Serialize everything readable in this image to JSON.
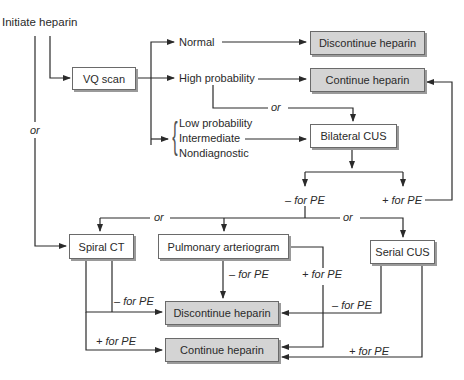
{
  "diagram": {
    "start": {
      "label": "Initiate heparin"
    },
    "nodes": {
      "vq_scan": "VQ scan",
      "discontinue_top": "Discontinue heparin",
      "continue_top": "Continue heparin",
      "bilateral_cus": "Bilateral CUS",
      "spiral_ct": "Spiral CT",
      "pulmonary_arteriogram": "Pulmonary arteriogram",
      "serial_cus": "Serial CUS",
      "discontinue_bottom": "Discontinue heparin",
      "continue_bottom": "Continue heparin"
    },
    "vq_results": {
      "normal": "Normal",
      "high": "High probability",
      "low": "Low probability",
      "intermediate": "Intermediate",
      "nondiagnostic": "Nondiagnostic"
    },
    "edge_labels": {
      "or": "or",
      "neg_pe": "– for PE",
      "pos_pe": "+ for PE"
    },
    "colors": {
      "result_box_fill": "#d4d4d4",
      "test_box_fill": "#ffffff",
      "line": "#2a2a2a"
    }
  }
}
